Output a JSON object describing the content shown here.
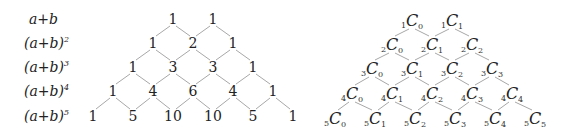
{
  "labels": [
    {
      "base": "a+b",
      "exp": ""
    },
    {
      "base": "(a+b)",
      "exp": "2"
    },
    {
      "base": "(a+b)",
      "exp": "3"
    },
    {
      "base": "(a+b)",
      "exp": "4"
    },
    {
      "base": "(a+b)",
      "exp": "5"
    }
  ],
  "pascal_numbers": [
    [
      "1",
      "1"
    ],
    [
      "1",
      "2",
      "1"
    ],
    [
      "1",
      "3",
      "3",
      "1"
    ],
    [
      "1",
      "4",
      "6",
      "4",
      "1"
    ],
    [
      "1",
      "5",
      "10",
      "10",
      "5",
      "1"
    ]
  ],
  "combination_triangle": [
    [
      {
        "n": "1",
        "r": "0"
      },
      {
        "n": "1",
        "r": "1"
      }
    ],
    [
      {
        "n": "2",
        "r": "0"
      },
      {
        "n": "2",
        "r": "1"
      },
      {
        "n": "2",
        "r": "2"
      }
    ],
    [
      {
        "n": "3",
        "r": "0"
      },
      {
        "n": "3",
        "r": "1"
      },
      {
        "n": "3",
        "r": "2"
      },
      {
        "n": "3",
        "r": "3"
      }
    ],
    [
      {
        "n": "4",
        "r": "0"
      },
      {
        "n": "4",
        "r": "1"
      },
      {
        "n": "4",
        "r": "2"
      },
      {
        "n": "4",
        "r": "3"
      },
      {
        "n": "4",
        "r": "4"
      }
    ],
    [
      {
        "n": "5",
        "r": "0"
      },
      {
        "n": "5",
        "r": "1"
      },
      {
        "n": "5",
        "r": "2"
      },
      {
        "n": "5",
        "r": "3"
      },
      {
        "n": "5",
        "r": "4"
      },
      {
        "n": "5",
        "r": "5"
      }
    ]
  ],
  "combination_symbol": "C",
  "colors": {
    "text": "#222222",
    "edges": "#a8a8a8",
    "background": "#ffffff"
  }
}
